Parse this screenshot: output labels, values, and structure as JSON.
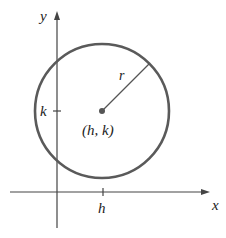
{
  "diagram": {
    "axes": {
      "x_label": "x",
      "y_label": "y"
    },
    "ticks": {
      "x_tick_label": "h",
      "y_tick_label": "k"
    },
    "center_label": "(h, k)",
    "radius_label": "r",
    "colors": {
      "circle": "#5a5a5a",
      "axes": "#444444",
      "text": "#222222"
    }
  }
}
